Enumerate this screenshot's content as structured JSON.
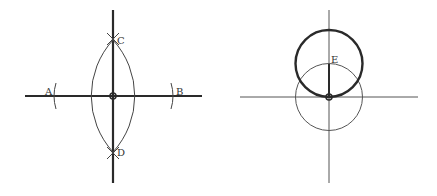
{
  "figures": [
    {
      "id": "perpendicular-bisector",
      "description": "Perpendicular bisector construction of segment AB",
      "labels": {
        "A": "A",
        "B": "B",
        "C": "C",
        "D": "D"
      }
    },
    {
      "id": "tangent-circles",
      "description": "Circle through center point with radius to point E",
      "labels": {
        "E": "E"
      }
    }
  ],
  "colors": {
    "bold_line": "#2a2a2a",
    "thin_line": "#555555",
    "background": "#ffffff"
  }
}
